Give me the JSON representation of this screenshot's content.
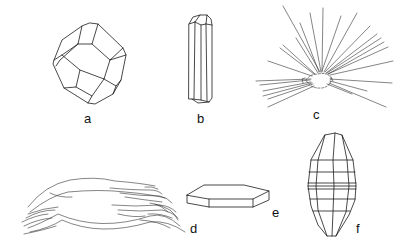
{
  "figure": {
    "panels": [
      {
        "id": "a",
        "label": "a",
        "shape": "equant-polyhedral-crystal"
      },
      {
        "id": "b",
        "label": "b",
        "shape": "prismatic-columnar-crystal"
      },
      {
        "id": "c",
        "label": "c",
        "shape": "acicular-radiating-needles"
      },
      {
        "id": "d",
        "label": "d",
        "shape": "fibrous-crystal-bundle"
      },
      {
        "id": "e",
        "label": "e",
        "shape": "tabular-hexagonal-plate"
      },
      {
        "id": "f",
        "label": "f",
        "shape": "bipyramidal-barrel-crystal"
      }
    ],
    "colors": {
      "line": "#1a1a1a",
      "background": "#ffffff"
    }
  }
}
